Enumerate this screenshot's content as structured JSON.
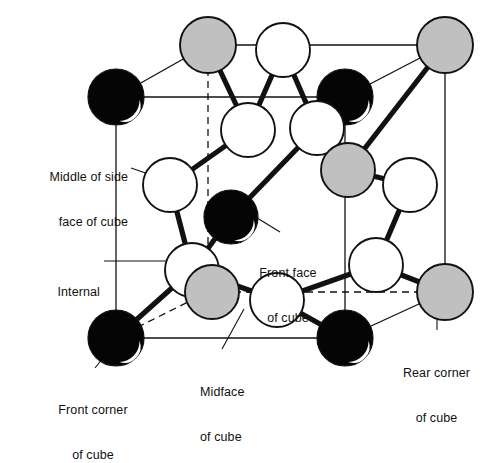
{
  "figure": {
    "background_color": "#ffffff",
    "line_color": "#111111",
    "sphere_colors": {
      "black": "#050505",
      "white": "#ffffff",
      "gray": "#c0c0c0",
      "outline": "#111111",
      "highlight": "#ffffff"
    }
  },
  "labels": [
    {
      "id": "middle-of-side-face",
      "line1": "Middle of side",
      "line2": "face of cube",
      "x": 8,
      "y": 140,
      "width": 120,
      "align": "right"
    },
    {
      "id": "internal",
      "line1": "Internal",
      "line2": "",
      "x": 28,
      "y": 255,
      "width": 100,
      "align": "right"
    },
    {
      "id": "front-corner-of-cube",
      "line1": "Front corner",
      "line2": "of cube",
      "x": 30,
      "y": 373,
      "width": 130,
      "align": "center"
    },
    {
      "id": "front-face-of-cube",
      "line1": "Front face",
      "line2": "of cube",
      "x": 235,
      "y": 238,
      "width": 104,
      "align": "center"
    },
    {
      "id": "midface-of-cube",
      "line1": "Midface",
      "line2": "of cube",
      "x": 200,
      "y": 355,
      "width": 80,
      "align": "left"
    },
    {
      "id": "rear-corner-of-cube",
      "line1": "Rear corner",
      "line2": "of cube",
      "x": 390,
      "y": 336,
      "width": 95,
      "align": "center"
    }
  ],
  "cube": {
    "front_face": {
      "tl": [
        116,
        97
      ],
      "tr": [
        345,
        97
      ],
      "br": [
        345,
        338
      ],
      "bl": [
        116,
        338
      ]
    },
    "rear_face": {
      "tl": [
        208,
        45
      ],
      "tr": [
        445,
        45
      ],
      "br": [
        445,
        292
      ],
      "bl": [
        208,
        292
      ]
    }
  },
  "atoms": [
    {
      "id": "corner-front-top-left",
      "type": "black",
      "cx": 116,
      "cy": 97,
      "r": 28
    },
    {
      "id": "corner-front-top-right",
      "type": "black",
      "cx": 345,
      "cy": 97,
      "r": 28
    },
    {
      "id": "corner-front-bottom-left",
      "type": "black",
      "cx": 116,
      "cy": 338,
      "r": 28
    },
    {
      "id": "corner-front-bottom-right",
      "type": "black",
      "cx": 345,
      "cy": 338,
      "r": 28
    },
    {
      "id": "corner-rear-top-left",
      "type": "gray",
      "cx": 208,
      "cy": 45,
      "r": 28
    },
    {
      "id": "corner-rear-top-right",
      "type": "gray",
      "cx": 445,
      "cy": 45,
      "r": 28
    },
    {
      "id": "corner-rear-bottom-right",
      "type": "gray",
      "cx": 445,
      "cy": 292,
      "r": 28
    },
    {
      "id": "face-center-top",
      "type": "white",
      "cx": 283,
      "cy": 50,
      "r": 27
    },
    {
      "id": "internal-upper-left",
      "type": "white",
      "cx": 248,
      "cy": 130,
      "r": 27
    },
    {
      "id": "internal-upper-right",
      "type": "white",
      "cx": 317,
      "cy": 128,
      "r": 27
    },
    {
      "id": "face-center-left",
      "type": "white",
      "cx": 170,
      "cy": 185,
      "r": 27
    },
    {
      "id": "face-center-right",
      "type": "white",
      "cx": 410,
      "cy": 185,
      "r": 27
    },
    {
      "id": "front-face-center",
      "type": "black",
      "cx": 231,
      "cy": 217,
      "r": 27
    },
    {
      "id": "internal-lower-left",
      "type": "white",
      "cx": 192,
      "cy": 270,
      "r": 27
    },
    {
      "id": "midface-gray",
      "type": "gray",
      "cx": 212,
      "cy": 292,
      "r": 27
    },
    {
      "id": "face-center-bottom",
      "type": "white",
      "cx": 277,
      "cy": 300,
      "r": 27
    },
    {
      "id": "internal-right-lower",
      "type": "white",
      "cx": 376,
      "cy": 265,
      "r": 27
    },
    {
      "id": "midface-right",
      "type": "gray",
      "cx": 348,
      "cy": 170,
      "r": 27
    }
  ],
  "bonds": [
    {
      "from": "corner-rear-top-left",
      "to": "internal-upper-left"
    },
    {
      "from": "face-center-top",
      "to": "internal-upper-left"
    },
    {
      "from": "face-center-top",
      "to": "internal-upper-right"
    },
    {
      "from": "corner-front-top-right",
      "to": "internal-upper-right"
    },
    {
      "from": "internal-upper-left",
      "to": "face-center-left"
    },
    {
      "from": "internal-upper-right",
      "to": "midface-right"
    },
    {
      "from": "face-center-left",
      "to": "internal-lower-left"
    },
    {
      "from": "front-face-center",
      "to": "internal-upper-right"
    },
    {
      "from": "front-face-center",
      "to": "internal-lower-left"
    },
    {
      "from": "internal-lower-left",
      "to": "corner-front-bottom-left"
    },
    {
      "from": "internal-lower-left",
      "to": "face-center-bottom"
    },
    {
      "from": "face-center-bottom",
      "to": "corner-front-bottom-right"
    },
    {
      "from": "face-center-bottom",
      "to": "internal-right-lower"
    },
    {
      "from": "internal-right-lower",
      "to": "corner-rear-bottom-right"
    },
    {
      "from": "internal-right-lower",
      "to": "face-center-right"
    },
    {
      "from": "face-center-right",
      "to": "midface-right"
    },
    {
      "from": "midface-right",
      "to": "corner-rear-top-right"
    }
  ],
  "leaders": [
    {
      "id": "leader-middle-of-side-face",
      "x1": 131,
      "y1": 168,
      "x2": 175,
      "y2": 183
    },
    {
      "id": "leader-internal",
      "x1": 104,
      "y1": 261,
      "x2": 196,
      "y2": 261
    },
    {
      "id": "leader-front-corner",
      "x1": 95,
      "y1": 368,
      "x2": 114,
      "y2": 344
    },
    {
      "id": "leader-front-face",
      "x1": 280,
      "y1": 232,
      "x2": 249,
      "y2": 213
    },
    {
      "id": "leader-midface",
      "x1": 222,
      "y1": 349,
      "x2": 244,
      "y2": 309
    },
    {
      "id": "leader-rear-corner",
      "x1": 437,
      "y1": 330,
      "x2": 437,
      "y2": 302
    }
  ]
}
